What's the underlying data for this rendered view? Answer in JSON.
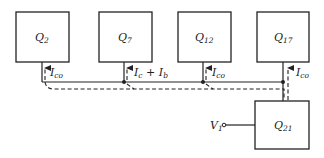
{
  "diagram": {
    "blocks": [
      {
        "id": "Q2",
        "label": "Q",
        "sub": "2"
      },
      {
        "id": "Q7",
        "label": "Q",
        "sub": "7"
      },
      {
        "id": "Q12",
        "label": "Q",
        "sub": "12"
      },
      {
        "id": "Q17",
        "label": "Q",
        "sub": "17"
      },
      {
        "id": "Q21",
        "label": "Q",
        "sub": "21"
      }
    ],
    "currents": [
      {
        "at": "Q2",
        "label": "I",
        "sub": "co"
      },
      {
        "at": "Q7",
        "label": "I",
        "sub": "c",
        "plus": " + ",
        "label2": "I",
        "sub2": "b"
      },
      {
        "at": "Q12",
        "label": "I",
        "sub": "co"
      },
      {
        "at": "Q17",
        "label": "I",
        "sub": "co"
      }
    ],
    "input": {
      "label": "V",
      "sub": "1"
    }
  }
}
